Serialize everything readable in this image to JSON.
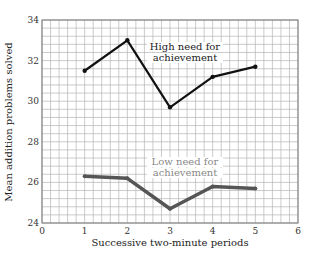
{
  "chart_data": {
    "type": "line",
    "title": "",
    "xlabel": "Successive two-minute periods",
    "ylabel": "Mean addition problems solved",
    "xlim": [
      0,
      6
    ],
    "ylim": [
      24,
      34
    ],
    "x_ticks": [
      "0",
      "1",
      "2",
      "3",
      "4",
      "5",
      "6"
    ],
    "y_ticks": [
      "24",
      "26",
      "28",
      "30",
      "32",
      "34"
    ],
    "grid": true,
    "x": [
      1,
      2,
      3,
      4,
      5
    ],
    "series": [
      {
        "name": "High need for achievement",
        "label_lines": [
          "High need for",
          "achievement"
        ],
        "color": "#111111",
        "values": [
          31.5,
          33.0,
          29.7,
          31.2,
          31.7
        ]
      },
      {
        "name": "Low need for achievement",
        "label_lines": [
          "Low need for",
          "achievement"
        ],
        "color": "#555555",
        "values": [
          26.3,
          26.2,
          24.7,
          25.8,
          25.7
        ]
      }
    ],
    "legend_position": "inline annotations"
  }
}
